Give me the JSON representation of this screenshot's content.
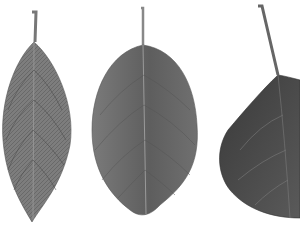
{
  "image": {
    "description": "Grayscale photograph of three leaves on a white background",
    "background": "#ffffff",
    "leaves": [
      {
        "name": "narrow-elliptic-leaf",
        "shade": "#7a7a7a",
        "vein": "#3a3a3a"
      },
      {
        "name": "ovate-leaf",
        "shade": "#6e6e6e",
        "vein": "#4a4a4a"
      },
      {
        "name": "cordate-leaf-cropped",
        "shade": "#4a4a4a",
        "vein": "#8a8a8a"
      }
    ]
  }
}
